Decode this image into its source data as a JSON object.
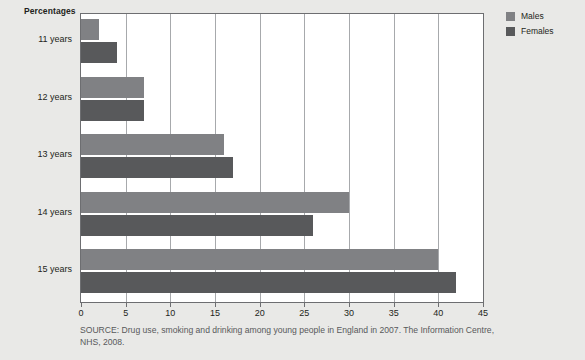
{
  "axis_caption": "Percentages",
  "legend": {
    "position": "right",
    "items": [
      {
        "label": "Males",
        "color": "#808184",
        "swatch_name": "legend-swatch-males"
      },
      {
        "label": "Females",
        "color": "#58595b",
        "swatch_name": "legend-swatch-females"
      }
    ]
  },
  "source": {
    "line1": "SOURCE: Drug use, smoking and drinking among young people in England in 2007. The Information Centre,",
    "line2": "NHS, 2008."
  },
  "chart_data": {
    "type": "bar",
    "orientation": "horizontal",
    "title": "",
    "subtitle": "",
    "xlabel": "Percentages",
    "ylabel": "",
    "xlim": [
      0,
      45
    ],
    "xticks": [
      0,
      5,
      10,
      15,
      20,
      25,
      30,
      35,
      40,
      45
    ],
    "xtick_labels": [
      "0",
      "5",
      "10",
      "15",
      "20",
      "25",
      "30",
      "35",
      "40",
      "45"
    ],
    "grid": true,
    "grid_axis": "x",
    "legend_position": "right",
    "categories": [
      "11 years",
      "12 years",
      "13 years",
      "14 years",
      "15 years"
    ],
    "series": [
      {
        "name": "Males",
        "color": "#808184",
        "values": [
          2,
          7,
          16,
          30,
          40
        ]
      },
      {
        "name": "Females",
        "color": "#58595b",
        "values": [
          4,
          7,
          17,
          26,
          42
        ]
      }
    ],
    "annotations": [
      "SOURCE: Drug use, smoking and drinking among young people in England in 2007. The Information Centre, NHS, 2008."
    ]
  }
}
